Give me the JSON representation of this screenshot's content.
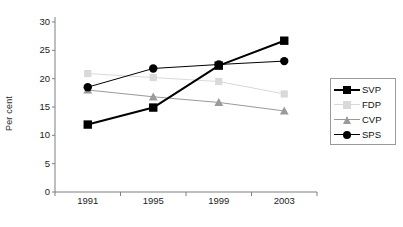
{
  "chart_data": {
    "type": "line",
    "title": "",
    "xlabel": "",
    "ylabel": "Per cent",
    "categories": [
      "1991",
      "1995",
      "1999",
      "2003"
    ],
    "ylim": [
      0,
      30
    ],
    "y_ticks": [
      0,
      5,
      10,
      15,
      20,
      25,
      30
    ],
    "grid": false,
    "legend_position": "right",
    "series": [
      {
        "name": "SVP",
        "values": [
          11.9,
          14.9,
          22.3,
          26.7
        ],
        "color": "#000000",
        "marker": "square",
        "line_width": 2.0
      },
      {
        "name": "FDP",
        "values": [
          20.9,
          20.2,
          19.5,
          17.3
        ],
        "color": "#d9d9d9",
        "marker": "square",
        "line_width": 1.0
      },
      {
        "name": "CVP",
        "values": [
          18.0,
          16.8,
          15.8,
          14.3
        ],
        "color": "#9a9a9a",
        "marker": "triangle",
        "line_width": 1.0
      },
      {
        "name": "SPS",
        "values": [
          18.5,
          21.8,
          22.5,
          23.1
        ],
        "color": "#000000",
        "marker": "circle",
        "line_width": 1.0
      }
    ]
  },
  "axes": {
    "y_tick_labels": [
      "30",
      "25",
      "20",
      "15",
      "10",
      "5",
      "0"
    ],
    "x_tick_labels": [
      "1991",
      "1995",
      "1999",
      "2003"
    ],
    "y_title": "Per cent",
    "axis_color": "#7f7f7f"
  },
  "legend": {
    "entries": [
      {
        "label": "SVP",
        "color": "#000000",
        "marker": "square"
      },
      {
        "label": "FDP",
        "color": "#d9d9d9",
        "marker": "square"
      },
      {
        "label": "CVP",
        "color": "#9a9a9a",
        "marker": "triangle"
      },
      {
        "label": "SPS",
        "color": "#000000",
        "marker": "circle"
      }
    ],
    "border_color": "#9a9a9a"
  }
}
